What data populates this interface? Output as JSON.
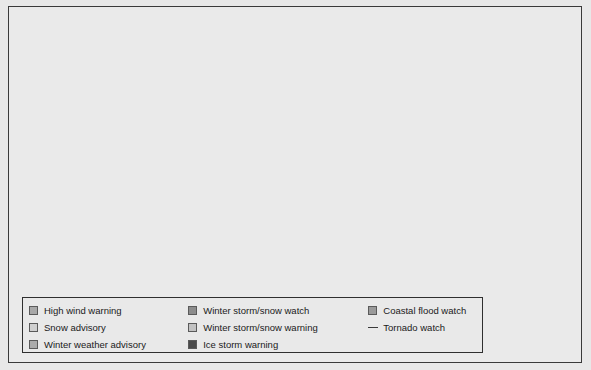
{
  "map": {
    "title": "United States weather hazards map",
    "background_color": "#e8e8e8",
    "land_color": "#ededed",
    "border_color": "#3f3f3f",
    "frame_color": "#3a3a3a"
  },
  "legend": {
    "columns": [
      {
        "items": [
          {
            "label": "High wind warning",
            "color": "#a8a8a8",
            "marker": "swatch"
          },
          {
            "label": "Snow advisory",
            "color": "#cfcfcf",
            "marker": "swatch"
          },
          {
            "label": "Winter weather advisory",
            "color": "#ababab",
            "marker": "swatch"
          }
        ]
      },
      {
        "items": [
          {
            "label": "Winter storm/snow watch",
            "color": "#8c8c8c",
            "marker": "swatch"
          },
          {
            "label": "Winter storm/snow warning",
            "color": "#c2c2c2",
            "marker": "swatch"
          },
          {
            "label": "Ice storm warning",
            "color": "#4a4a4a",
            "marker": "swatch"
          }
        ]
      },
      {
        "items": [
          {
            "label": "Coastal flood watch",
            "color": "#9a9a9a",
            "marker": "swatch"
          },
          {
            "label": "Tornado watch",
            "color": "#3a3a3a",
            "marker": "line"
          }
        ]
      }
    ]
  },
  "hazard_regions": [
    {
      "name": "pacific-northwest-cascades",
      "type": "winter-weather-advisory",
      "color": "#a8a8a8"
    },
    {
      "name": "washington-central",
      "type": "snow-advisory",
      "color": "#cfcfcf"
    },
    {
      "name": "oregon-cascades",
      "type": "high-wind-warning",
      "color": "#9e9e9e"
    },
    {
      "name": "idaho-panhandle",
      "type": "winter-storm-snow-watch",
      "color": "#8c8c8c"
    },
    {
      "name": "montana-west",
      "type": "snow-advisory",
      "color": "#c2c2c2"
    },
    {
      "name": "california-sierra",
      "type": "winter-weather-advisory",
      "color": "#a8a8a8"
    },
    {
      "name": "arizona-nevada-highlands",
      "type": "winter-storm-snow-warning",
      "color": "#b5b5b5"
    },
    {
      "name": "new-mexico-colorado",
      "type": "winter-storm-snow-warning",
      "color": "#adadad"
    },
    {
      "name": "texas-panhandle-oklahoma",
      "type": "winter-storm-snow-warning",
      "color": "#a5a5a5"
    },
    {
      "name": "kansas-missouri",
      "type": "winter-storm-snow-watch",
      "color": "#8c8c8c"
    },
    {
      "name": "missouri-ice-band",
      "type": "ice-storm-warning",
      "color": "#4a4a4a"
    },
    {
      "name": "illinois-indiana",
      "type": "winter-storm-snow-watch",
      "color": "#8c8c8c"
    },
    {
      "name": "michigan-lower",
      "type": "winter-storm-snow-watch",
      "color": "#8c8c8c"
    },
    {
      "name": "kentucky-west-virginia",
      "type": "ice-storm-warning",
      "color": "#4a4a4a"
    },
    {
      "name": "iowa-wisconsin",
      "type": "snow-advisory",
      "color": "#b8b8b8"
    },
    {
      "name": "dakotas-minnesota",
      "type": "snow-advisory",
      "color": "#cfcfcf"
    },
    {
      "name": "arkansas-louisiana-tornado",
      "type": "tornado-watch",
      "color": "#3a3a3a"
    }
  ]
}
